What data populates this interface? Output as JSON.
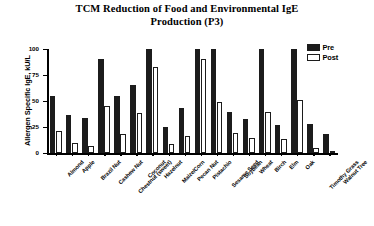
{
  "chart_data": {
    "type": "bar",
    "title": "TCM Reduction of Food and Environmental IgE Production (P3)",
    "title_line1": "TCM Reduction of Food and Environmental IgE",
    "title_line2": "Production (P3)",
    "xlabel": "",
    "ylabel": "Allergen Specific IgE, kU/L",
    "ylim": [
      0,
      100
    ],
    "yticks": [
      0,
      25,
      50,
      75,
      100
    ],
    "ytick_labels": [
      "0",
      "25",
      "50",
      "75",
      "100"
    ],
    "grid": false,
    "legend_position": "top-right",
    "categories": [
      "Almond",
      "Apple",
      "Brazil Nut",
      "Cashew Nut",
      "Chestnut (sweet)",
      "Coconut",
      "Hazelnut",
      "Maize/Corn",
      "Pecan Nut",
      "Pistachio",
      "Sesame Seed",
      "Soybean",
      "Wheat",
      "Birch",
      "Elm",
      "Oak",
      "Timothy Grass",
      "Walnut Tree"
    ],
    "series": [
      {
        "name": "Pre",
        "color": "#1c1c1c",
        "values": [
          55,
          37,
          34,
          90,
          55,
          65,
          100,
          25,
          43,
          100,
          100,
          39,
          33,
          100,
          27,
          100,
          28,
          18
        ]
      },
      {
        "name": "Post",
        "color": "#ffffff",
        "values": [
          21,
          10,
          7,
          45,
          18,
          38,
          83,
          9,
          16,
          90,
          49,
          19,
          14,
          39,
          13,
          51,
          5,
          2
        ]
      }
    ],
    "groups": [
      {
        "label_line1": "Food",
        "label_line2": "allergens",
        "start_index": 0,
        "end_index": 12
      },
      {
        "label_line1": "Environmental",
        "label_line2": "allergens",
        "start_index": 13,
        "end_index": 17
      }
    ]
  }
}
